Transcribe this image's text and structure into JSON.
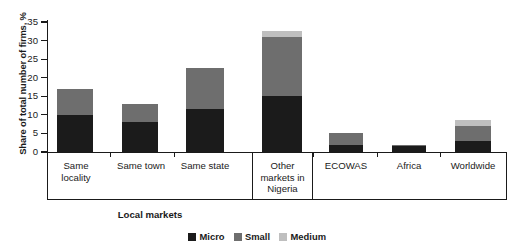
{
  "chart_data": {
    "type": "bar",
    "stacked": true,
    "title": "",
    "xlabel": "Local markets",
    "ylabel": "Share of total number of firms, %",
    "ylim": [
      0,
      35
    ],
    "yticks": [
      0,
      5,
      10,
      15,
      20,
      25,
      30,
      35
    ],
    "grid": false,
    "legend_position": "bottom-center",
    "categories": [
      "Same\nlocality",
      "Same town",
      "Same state",
      "Other\nmarkets in\nNigeria",
      "ECOWAS",
      "Africa",
      "Worldwide"
    ],
    "series": [
      {
        "name": "Micro",
        "color": "#1b1b1b",
        "values": [
          10.0,
          8.0,
          11.5,
          15.0,
          2.0,
          1.5,
          3.0
        ]
      },
      {
        "name": "Small",
        "color": "#6e6e6e",
        "values": [
          7.0,
          5.0,
          11.0,
          16.0,
          3.0,
          0.5,
          4.0
        ]
      },
      {
        "name": "Medium",
        "color": "#bfbfbf",
        "values": [
          0.0,
          0.0,
          0.0,
          1.5,
          0.0,
          0.0,
          1.5
        ]
      }
    ],
    "totals": [
      17.0,
      13.0,
      22.5,
      32.5,
      5.0,
      2.0,
      8.5
    ]
  },
  "axis": {
    "y_tick_labels": [
      "0",
      "5",
      "10",
      "15",
      "20",
      "25",
      "30",
      "35"
    ]
  },
  "legend": {
    "items": [
      {
        "label": "Micro",
        "color": "#1b1b1b"
      },
      {
        "label": "Small",
        "color": "#6e6e6e"
      },
      {
        "label": "Medium",
        "color": "#bfbfbf"
      }
    ]
  }
}
